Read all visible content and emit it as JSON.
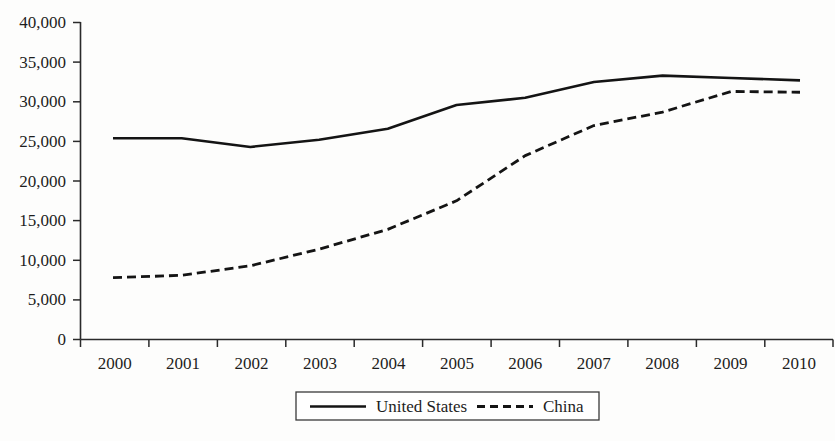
{
  "chart_data": {
    "type": "line",
    "title": "",
    "xlabel": "",
    "ylabel": "",
    "categories": [
      "2000",
      "2001",
      "2002",
      "2003",
      "2004",
      "2005",
      "2006",
      "2007",
      "2008",
      "2009",
      "2010"
    ],
    "series": [
      {
        "name": "United States",
        "style": "solid",
        "color": "#141414",
        "values": [
          25400,
          25400,
          24300,
          25200,
          26600,
          29600,
          30500,
          32500,
          33300,
          33000,
          32700
        ]
      },
      {
        "name": "China",
        "style": "dashed",
        "color": "#141414",
        "values": [
          7800,
          8100,
          9300,
          11400,
          13900,
          17500,
          23200,
          27000,
          28700,
          31300,
          31200
        ]
      }
    ],
    "ylim": [
      0,
      40000
    ],
    "ytick_values": [
      0,
      5000,
      10000,
      15000,
      20000,
      25000,
      30000,
      35000,
      40000
    ],
    "ytick_labels": [
      "0",
      "5,000",
      "10,000",
      "15,000",
      "20,000",
      "25,000",
      "30,000",
      "35,000",
      "40,000"
    ],
    "xtick_labels": [
      "2000",
      "2001",
      "2002",
      "2003",
      "2004",
      "2005",
      "2006",
      "2007",
      "2008",
      "2009",
      "2010"
    ],
    "grid": false,
    "legend_position": "bottom-center",
    "legend_entries": [
      "United States",
      "China"
    ]
  }
}
